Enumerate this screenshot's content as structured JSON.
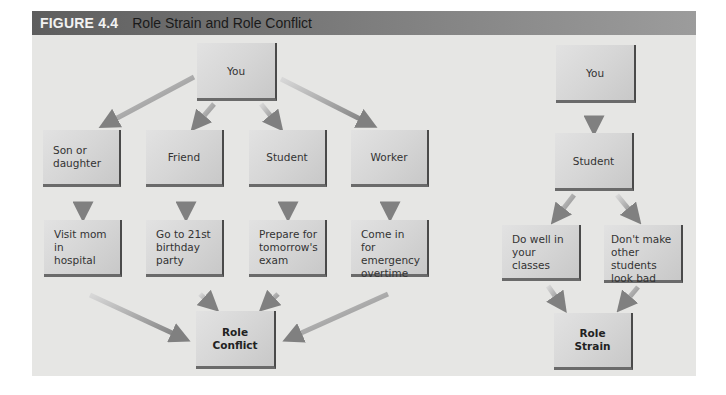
{
  "figure": {
    "number": "FIGURE 4.4",
    "title": "Role Strain and Role Conflict"
  },
  "role_conflict_diagram": {
    "root": {
      "label": "You"
    },
    "roles": [
      {
        "label": "Son or\ndaughter"
      },
      {
        "label": "Friend"
      },
      {
        "label": "Student"
      },
      {
        "label": "Worker"
      }
    ],
    "demands": [
      {
        "label": "Visit mom in\nhospital"
      },
      {
        "label": "Go to 21st\nbirthday\nparty"
      },
      {
        "label": "Prepare for\ntomorrow's\nexam"
      },
      {
        "label": "Come in for\nemergency\novertime"
      }
    ],
    "result": {
      "label": "Role Conflict"
    }
  },
  "role_strain_diagram": {
    "root": {
      "label": "You"
    },
    "role": {
      "label": "Student"
    },
    "demands": [
      {
        "label": "Do well in\nyour classes"
      },
      {
        "label": "Don't make\nother students\nlook bad"
      }
    ],
    "result": {
      "label": "Role\nStrain"
    }
  },
  "colors": {
    "header_dark": "#5e5e5e",
    "header_light": "#9c9c9c",
    "header_number_text": "#f2f2f2",
    "panel_bg": "#e6e6e4",
    "box_light": "#e2e2e2",
    "box_dark": "#c8c8c8",
    "box_edge": "#4a4a4a",
    "arrow": "#8a8a8a"
  }
}
